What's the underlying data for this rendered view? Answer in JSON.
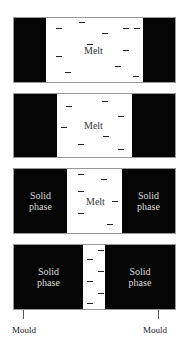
{
  "diagram": {
    "panels": [
      {
        "stage": 1,
        "top": 17,
        "height": 66,
        "left_solid_width": 32,
        "right_solid_width": 32,
        "melt_label": "Melt",
        "solid_label": "",
        "melt_label_pos": [
          70,
          27
        ],
        "dashes": [
          [
            42,
            10
          ],
          [
            65,
            4
          ],
          [
            73,
            26
          ],
          [
            88,
            15
          ],
          [
            109,
            10
          ],
          [
            120,
            10
          ],
          [
            42,
            38
          ],
          [
            109,
            32
          ],
          [
            51,
            54
          ],
          [
            101,
            48
          ],
          [
            119,
            58
          ]
        ]
      },
      {
        "stage": 2,
        "top": 93,
        "height": 65,
        "left_solid_width": 43,
        "right_solid_width": 43,
        "melt_label": "Melt",
        "solid_label": "",
        "melt_label_pos": [
          70,
          26
        ],
        "dashes": [
          [
            52,
            12
          ],
          [
            88,
            7
          ],
          [
            104,
            22
          ],
          [
            47,
            33
          ],
          [
            89,
            42
          ],
          [
            64,
            50
          ],
          [
            104,
            55
          ]
        ]
      },
      {
        "stage": 3,
        "top": 168,
        "height": 66,
        "left_solid_width": 53,
        "right_solid_width": 53,
        "melt_label": "Melt",
        "solid_label": "Solid\nphase",
        "melt_label_pos": [
          72,
          27
        ],
        "dashes": [
          [
            64,
            5
          ],
          [
            87,
            10
          ],
          [
            64,
            22
          ],
          [
            98,
            32
          ],
          [
            64,
            44
          ],
          [
            93,
            55
          ]
        ]
      },
      {
        "stage": 4,
        "top": 244,
        "height": 66,
        "left_solid_width": 69,
        "right_solid_width": 70,
        "melt_label": "",
        "solid_label": "Solid\nphase",
        "melt_label_pos": null,
        "dashes": [
          [
            84,
            5
          ],
          [
            73,
            14
          ],
          [
            84,
            26
          ],
          [
            73,
            36
          ],
          [
            84,
            48
          ],
          [
            73,
            58
          ]
        ]
      }
    ],
    "labels": {
      "melt": "Melt",
      "solid_line1": "Solid",
      "solid_line2": "phase",
      "mould_left": "Mould",
      "mould_right": "Mould"
    },
    "colors": {
      "solid": "#050505",
      "melt": "#ffffff",
      "dash": "#222222"
    }
  }
}
